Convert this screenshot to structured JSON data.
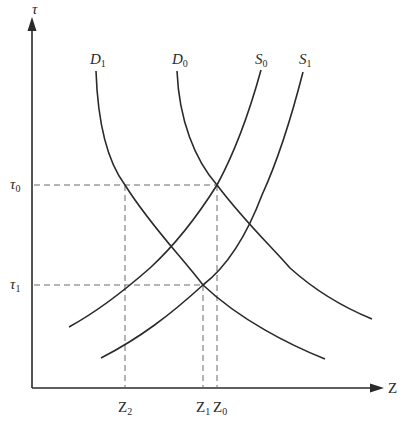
{
  "diagram": {
    "type": "supply-demand-shift",
    "colors": {
      "curve": "#2a2a2a",
      "axis": "#2a2a2a",
      "guide": "#6a6a6a",
      "background": "#ffffff"
    },
    "axes": {
      "y": {
        "label": "τ"
      },
      "x": {
        "label": "Z"
      }
    },
    "curves": [
      {
        "id": "D1",
        "name": "D",
        "sub": "1",
        "kind": "demand"
      },
      {
        "id": "D0",
        "name": "D",
        "sub": "0",
        "kind": "demand"
      },
      {
        "id": "S0",
        "name": "S",
        "sub": "0",
        "kind": "supply"
      },
      {
        "id": "S1",
        "name": "S",
        "sub": "1",
        "kind": "supply"
      }
    ],
    "y_ticks": [
      {
        "name": "τ",
        "sub": "0"
      },
      {
        "name": "τ",
        "sub": "1"
      }
    ],
    "x_ticks": [
      {
        "name": "Z",
        "sub": "2"
      },
      {
        "name": "Z",
        "sub": "1"
      },
      {
        "name": "Z",
        "sub": "0"
      }
    ]
  }
}
